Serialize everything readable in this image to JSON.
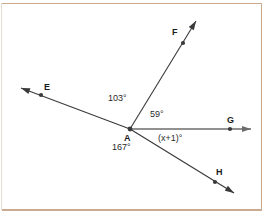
{
  "figure": {
    "vertex": {
      "name": "A",
      "x": 130,
      "y": 129
    },
    "colors": {
      "line": "#3a3a3a",
      "ray_ag": "#6d6d6d",
      "text": "#1b1b1b",
      "frame": "#c9a88c",
      "background": "#ffffff"
    },
    "points": [
      {
        "id": "E",
        "label": "E",
        "dot_x": 41,
        "dot_y": 95,
        "label_x": 44,
        "label_y": 83,
        "tip_x": 21,
        "tip_y": 88
      },
      {
        "id": "F",
        "label": "F",
        "dot_x": 183,
        "dot_y": 43,
        "label_x": 172,
        "label_y": 28,
        "tip_x": 196,
        "tip_y": 21
      },
      {
        "id": "G",
        "label": "G",
        "dot_x": 230,
        "dot_y": 129,
        "label_x": 227,
        "label_y": 116,
        "tip_x": 251,
        "tip_y": 129
      },
      {
        "id": "H",
        "label": "H",
        "dot_x": 215,
        "dot_y": 182,
        "label_x": 216,
        "label_y": 168,
        "tip_x": 234,
        "tip_y": 193
      }
    ],
    "rays": [
      {
        "id": "AE",
        "from": "A",
        "to": "E",
        "arrow": true
      },
      {
        "id": "AF",
        "from": "A",
        "to": "F",
        "arrow": true
      },
      {
        "id": "AG",
        "from": "A",
        "to": "G",
        "arrow": true
      },
      {
        "id": "AH",
        "from": "A",
        "to": "H",
        "arrow": true
      }
    ],
    "angle_labels": [
      {
        "id": "angle-EAF",
        "text": "103°",
        "x": 108,
        "y": 94,
        "between": [
          "E",
          "F"
        ]
      },
      {
        "id": "angle-FAG",
        "text": "59°",
        "x": 150,
        "y": 110,
        "between": [
          "F",
          "G"
        ]
      },
      {
        "id": "angle-GAH",
        "text": "(x+1)°",
        "x": 158,
        "y": 134,
        "between": [
          "G",
          "H"
        ]
      },
      {
        "id": "angle-EAH",
        "text": "167°",
        "x": 112,
        "y": 143,
        "between": [
          "E",
          "H"
        ]
      }
    ],
    "vertex_label": {
      "text": "A",
      "x": 124,
      "y": 134
    }
  }
}
